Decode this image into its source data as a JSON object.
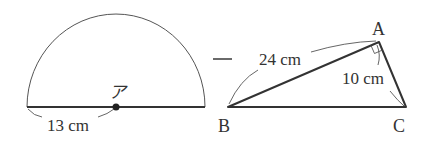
{
  "figure": {
    "semicircle": {
      "center_label": "ア",
      "radius_label": "13 cm"
    },
    "operator": "−",
    "triangle": {
      "vertices": {
        "A": "A",
        "B": "B",
        "C": "C"
      },
      "side_AB_label": "24 cm",
      "side_AC_label": "10 cm",
      "right_angle_at": "A"
    }
  },
  "colors": {
    "stroke": "#333333",
    "thin_stroke": "#555555",
    "background": "#ffffff"
  }
}
